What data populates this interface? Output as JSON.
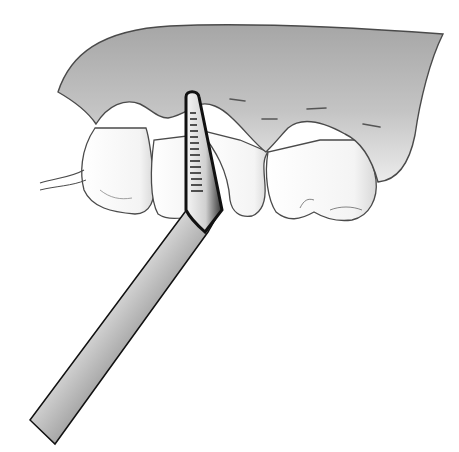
{
  "illustration": {
    "subject": "periodontal-probe-measuring-gingival-sulcus",
    "elements": [
      "gingiva",
      "teeth",
      "periodontal-probe",
      "probe-markings",
      "cej-dash-marks"
    ],
    "colors": {
      "background": "#ffffff",
      "gum_top": "#a8a8a8",
      "gum_bottom": "#e6e6e6",
      "outline": "#4a4a4a",
      "tooth_fill": "#ffffff",
      "probe_dark": "#1a1a1a",
      "probe_light": "#f2f2f2"
    },
    "probe_marking_count": 14,
    "dash_mark_count": 4
  }
}
